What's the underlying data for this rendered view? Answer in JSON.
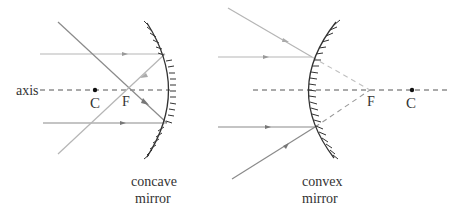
{
  "colors": {
    "ray": "#b5b5b5",
    "ray_dark": "#8a8a8a",
    "mirror": "#333333",
    "axis": "#555555",
    "text": "#333333"
  },
  "left_panel": {
    "axis_label": "axis",
    "point_c": "C",
    "point_f": "F",
    "caption_line1": "concave",
    "caption_line2": "mirror"
  },
  "right_panel": {
    "point_f": "F",
    "point_c": "C",
    "caption_line1": "convex",
    "caption_line2": "mirror"
  }
}
